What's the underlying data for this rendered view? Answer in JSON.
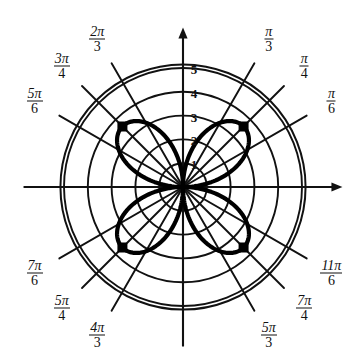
{
  "figure": {
    "background_color": "#ffffff",
    "ink_color": "#111111",
    "curve_color": "#000000"
  },
  "chart_data": {
    "type": "line",
    "coordinate_system": "polar",
    "title": "",
    "xlabel": "",
    "ylabel": "",
    "grid": true,
    "legend_position": "none",
    "equation": "r = 3.6 sin(2θ)",
    "petal_count": 4,
    "petal_max_radius": 3.6,
    "petal_tip_angles_deg": [
      45,
      135,
      225,
      315
    ],
    "radial_ticks": [
      {
        "value": 1,
        "label": "1"
      },
      {
        "value": 2,
        "label": "2"
      },
      {
        "value": 3,
        "label": "3"
      },
      {
        "value": 4,
        "label": "4"
      },
      {
        "value": 5,
        "label": "5"
      }
    ],
    "rlim": [
      0,
      5.15
    ],
    "radial_tick_labels": [
      "5",
      "4",
      "3",
      "2",
      "1"
    ],
    "angular_ticks": [
      {
        "angle_deg": 30,
        "num": "π",
        "den": "6",
        "label": "π/6"
      },
      {
        "angle_deg": 45,
        "num": "π",
        "den": "4",
        "label": "π/4"
      },
      {
        "angle_deg": 60,
        "num": "π",
        "den": "3",
        "label": "π/3"
      },
      {
        "angle_deg": 120,
        "num": "2π",
        "den": "3",
        "label": "2π/3"
      },
      {
        "angle_deg": 135,
        "num": "3π",
        "den": "4",
        "label": "3π/4"
      },
      {
        "angle_deg": 150,
        "num": "5π",
        "den": "6",
        "label": "5π/6"
      },
      {
        "angle_deg": 210,
        "num": "7π",
        "den": "6",
        "label": "7π/6"
      },
      {
        "angle_deg": 225,
        "num": "5π",
        "den": "4",
        "label": "5π/4"
      },
      {
        "angle_deg": 240,
        "num": "4π",
        "den": "3",
        "label": "4π/3"
      },
      {
        "angle_deg": 300,
        "num": "5π",
        "den": "3",
        "label": "5π/3"
      },
      {
        "angle_deg": 315,
        "num": "7π",
        "den": "4",
        "label": "7π/4"
      },
      {
        "angle_deg": 330,
        "num": "11π",
        "den": "6",
        "label": "11π/6"
      }
    ],
    "axes": {
      "horizontal_axis_arrow": true,
      "vertical_axis_arrow": true
    }
  },
  "geometry": {
    "center_x": 183,
    "center_y": 187,
    "unit_px": 23.8,
    "outer_ring_radius_units": 5.15
  }
}
